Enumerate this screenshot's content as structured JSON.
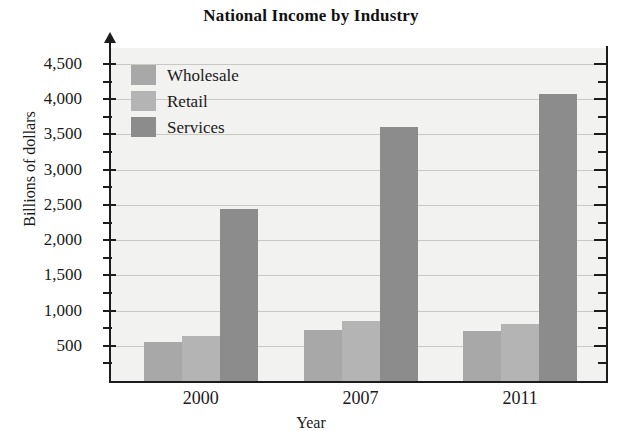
{
  "chart_data": {
    "type": "bar",
    "title": "National Income by Industry",
    "xlabel": "Year",
    "ylabel": "Billions of dollars",
    "categories": [
      "2000",
      "2007",
      "2011"
    ],
    "series": [
      {
        "name": "Wholesale",
        "values": [
          560,
          730,
          710
        ],
        "color": "#a8a8a8"
      },
      {
        "name": "Retail",
        "values": [
          640,
          855,
          815
        ],
        "color": "#b4b4b4"
      },
      {
        "name": "Services",
        "values": [
          2440,
          3610,
          4080
        ],
        "color": "#8c8c8c"
      }
    ],
    "ylim": [
      0,
      4600
    ],
    "ytick_labels": [
      "500",
      "1,000",
      "1,500",
      "2,000",
      "2,500",
      "3,000",
      "3,500",
      "4,000",
      "4,500"
    ],
    "ytick_values": [
      500,
      1000,
      1500,
      2000,
      2500,
      3000,
      3500,
      4000,
      4500
    ],
    "yminor_values": [
      250,
      750,
      1250,
      1750,
      2250,
      2750,
      3250,
      3750,
      4250
    ],
    "grid": true,
    "grid_axis": "y",
    "legend_position": "top-left",
    "plot_background": "#f2f2f0",
    "axis_color": "#1c1c1c",
    "grid_color": "#c9c9c4"
  }
}
